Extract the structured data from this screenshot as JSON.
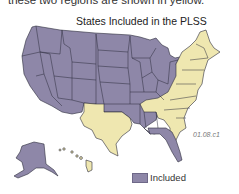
{
  "caption_partial": "these two regions are shown in yellow.",
  "map": {
    "title": "States Included in the PLSS",
    "figure_code": "01.08.c1",
    "colors": {
      "included": "#8e87a8",
      "not_included": "#efe7b0",
      "border": "#2b2b3a"
    },
    "legend": [
      {
        "label": "Included",
        "color": "#8e87a8"
      }
    ],
    "included_region": "Western, Midwestern and Gulf states (excluding Texas), Alaska",
    "not_included_region": "Original colonies / Eastern seaboard, Kentucky, Tennessee, West Virginia, Texas, Hawaii"
  }
}
